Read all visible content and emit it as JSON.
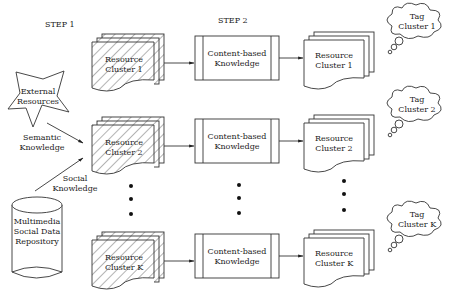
{
  "steps": {
    "step1": "STEP 1",
    "step2": "STEP 2"
  },
  "sources": {
    "external": [
      "External",
      "Resources"
    ],
    "repository": [
      "Multimedia",
      "Social Data",
      "Repository"
    ],
    "semantic_edge": [
      "Semantic",
      "Knowledge"
    ],
    "social_edge": [
      "Social",
      "Knowledge"
    ]
  },
  "rows": [
    {
      "input_cluster": [
        "Resource",
        "Cluster 1"
      ],
      "process": [
        "Content-based",
        "Knowledge"
      ],
      "output_cluster": [
        "Resource",
        "Cluster 1"
      ],
      "tag_cluster": [
        "Tag",
        "Cluster 1"
      ]
    },
    {
      "input_cluster": [
        "Resource",
        "Cluster 2"
      ],
      "process": [
        "Content-based",
        "Knowledge"
      ],
      "output_cluster": [
        "Resource",
        "Cluster 2"
      ],
      "tag_cluster": [
        "Tag",
        "Cluster 2"
      ]
    },
    {
      "input_cluster": [
        "Resource",
        "Cluster K"
      ],
      "process": [
        "Content-based",
        "Knowledge"
      ],
      "output_cluster": [
        "Resource",
        "Cluster K"
      ],
      "tag_cluster": [
        "Tag",
        "Cluster K"
      ]
    }
  ],
  "ellipsis": "…"
}
